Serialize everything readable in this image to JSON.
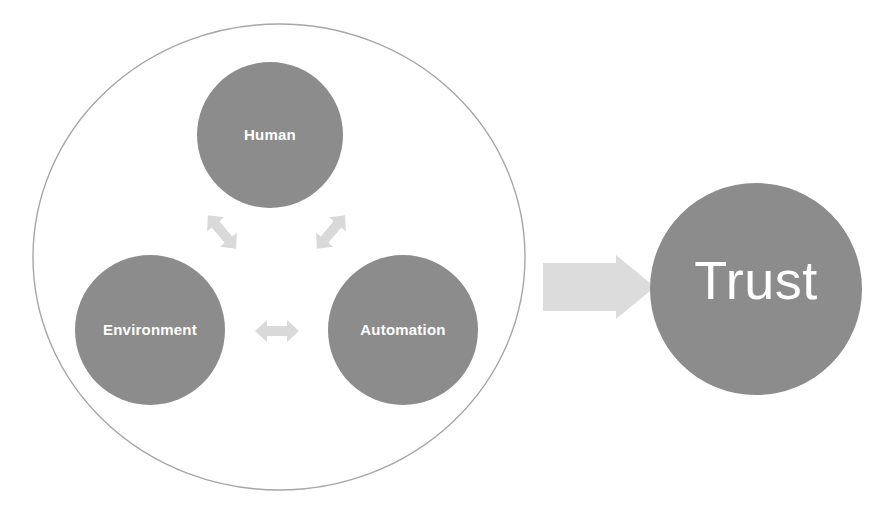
{
  "diagram": {
    "type": "concept-diagram",
    "title": "",
    "colors": {
      "node_fill": "#8c8c8c",
      "node_label": "#ffffff",
      "boundary_stroke": "#a6a6a6",
      "small_arrow_fill": "#d9d9d9",
      "big_arrow_fill": "#dcdcdc",
      "background": "#ffffff"
    },
    "boundary": {
      "shape": "ellipse",
      "cx": 279,
      "cy": 257,
      "rx": 246,
      "ry": 233,
      "stroke_width": 1.4,
      "fill": "none"
    },
    "nodes": [
      {
        "id": "human",
        "label": "Human",
        "cx": 270,
        "cy": 135,
        "r": 73,
        "font_size": 15
      },
      {
        "id": "environment",
        "label": "Environment",
        "cx": 150,
        "cy": 330,
        "r": 75,
        "font_size": 15
      },
      {
        "id": "automation",
        "label": "Automation",
        "cx": 403,
        "cy": 330,
        "r": 75,
        "font_size": 15
      }
    ],
    "connectors": [
      {
        "id": "human-environment",
        "from": "human",
        "to": "environment",
        "kind": "double-headed-arrow",
        "orientation": "diagonal-down-left",
        "cx": 222,
        "cy": 232,
        "angle": 230
      },
      {
        "id": "human-automation",
        "from": "human",
        "to": "automation",
        "kind": "double-headed-arrow",
        "orientation": "diagonal-down-right",
        "cx": 331,
        "cy": 232,
        "angle": 310
      },
      {
        "id": "environment-automation",
        "from": "environment",
        "to": "automation",
        "kind": "double-headed-arrow",
        "orientation": "horizontal",
        "cx": 277,
        "cy": 331,
        "angle": 0
      }
    ],
    "outcome_arrow": {
      "id": "to-trust",
      "kind": "block-arrow",
      "direction": "right",
      "x": 543,
      "y": 255,
      "width": 112,
      "height": 64
    },
    "outcome": {
      "id": "trust",
      "label": "Trust",
      "cx": 756,
      "cy": 289,
      "r": 106,
      "font_size": 54
    }
  }
}
